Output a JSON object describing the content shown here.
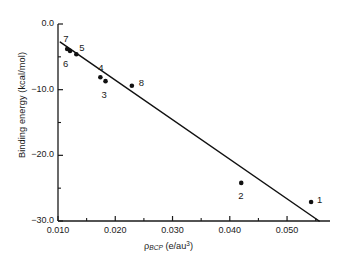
{
  "chart_data": {
    "type": "scatter",
    "title": "",
    "xlabel": "ρ_BCP (e/au³)",
    "ylabel": "Binding energy (kcal/mol)",
    "xlim": [
      0.01,
      0.0575
    ],
    "ylim": [
      -30.0,
      0.0
    ],
    "grid": false,
    "legend": "none",
    "x_major_ticks": [
      0.01,
      0.02,
      0.03,
      0.04,
      0.05
    ],
    "x_major_tick_labels": [
      "0.010",
      "0.020",
      "0.030",
      "0.040",
      "0.050"
    ],
    "x_minor_ticks": [
      0.015,
      0.025,
      0.035,
      0.045,
      0.055
    ],
    "y_major_ticks": [
      0.0,
      -10.0,
      -20.0,
      -30.0
    ],
    "y_major_tick_labels": [
      "0.0",
      "-10.0",
      "-20.0",
      "-30.0"
    ],
    "y_minor_ticks": [
      -5.0,
      -15.0,
      -25.0
    ],
    "points": [
      {
        "label": "1",
        "x": 0.0542,
        "y": -27.1,
        "label_dx": 9,
        "label_dy": -2
      },
      {
        "label": "2",
        "x": 0.042,
        "y": -24.2,
        "label_dx": 0,
        "label_dy": 13
      },
      {
        "label": "3",
        "x": 0.0183,
        "y": -8.7,
        "label_dx": -1,
        "label_dy": 14
      },
      {
        "label": "4",
        "x": 0.0174,
        "y": -8.1,
        "label_dx": 1,
        "label_dy": -9
      },
      {
        "label": "5",
        "x": 0.0132,
        "y": -4.6,
        "label_dx": 6,
        "label_dy": -6
      },
      {
        "label": "6",
        "x": 0.0121,
        "y": -4.1,
        "label_dx": -4,
        "label_dy": 13
      },
      {
        "label": "7",
        "x": 0.0116,
        "y": -3.8,
        "label_dx": -1,
        "label_dy": -10
      },
      {
        "label": "8",
        "x": 0.0229,
        "y": -9.4,
        "label_dx": 10,
        "label_dy": -3
      }
    ],
    "fit_line": {
      "x_start": 0.0104,
      "y_start": -2.75,
      "x_end": 0.0556,
      "y_end": -30.0
    },
    "colors": {
      "axis": "#1a1a1a",
      "marker": "#111111",
      "line": "#111111",
      "background": "#ffffff"
    }
  },
  "axis_geometry": {
    "left": 58,
    "right": 330,
    "top": 24,
    "bottom": 221
  }
}
